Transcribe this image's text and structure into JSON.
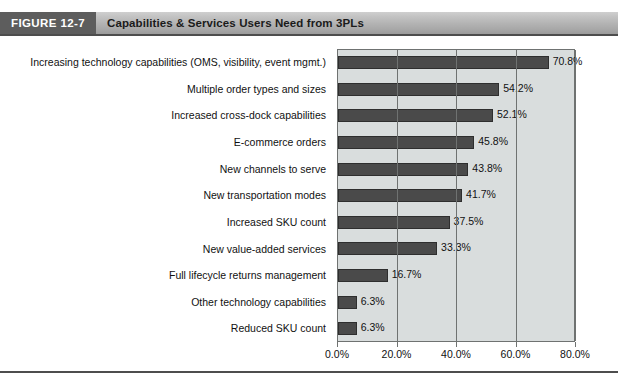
{
  "figure": {
    "tag": "FIGURE 12-7",
    "title": "Capabilities & Services Users Need from 3PLs"
  },
  "chart_data": {
    "type": "bar",
    "orientation": "horizontal",
    "title": "Capabilities & Services Users Need from 3PLs",
    "xlabel": "",
    "ylabel": "",
    "xlim": [
      0,
      80
    ],
    "xticks": [
      0,
      20,
      40,
      60,
      80
    ],
    "xtick_labels": [
      "0.0%",
      "20.0%",
      "40.0%",
      "60.0%",
      "80.0%"
    ],
    "grid": "vertical",
    "legend": "none",
    "bar_color": "#4a4a4a",
    "plot_background": "#d9dddd",
    "categories": [
      "Increasing technology capabilities (OMS, visibility, event mgmt.)",
      "Multiple order types and sizes",
      "Increased cross-dock capabilities",
      "E-commerce orders",
      "New channels to serve",
      "New transportation modes",
      "Increased SKU count",
      "New value-added services",
      "Full lifecycle returns management",
      "Other technology capabilities",
      "Reduced SKU count"
    ],
    "values": [
      70.8,
      54.2,
      52.1,
      45.8,
      43.8,
      41.7,
      37.5,
      33.3,
      16.7,
      6.3,
      6.3
    ],
    "value_labels": [
      "70.8%",
      "54.2%",
      "52.1%",
      "45.8%",
      "43.8%",
      "41.7%",
      "37.5%",
      "33.3%",
      "16.7%",
      "6.3%",
      "6.3%"
    ]
  }
}
